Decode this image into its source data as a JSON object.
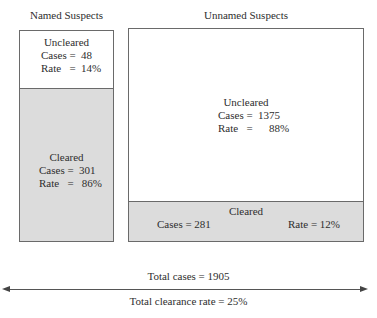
{
  "named": {
    "title": "Named Suspects",
    "uncleared": {
      "label": "Uncleared",
      "cases": "Cases =  48",
      "rate": "Rate   =  14%"
    },
    "cleared": {
      "label": "Cleared",
      "cases": "Cases =  301",
      "rate": "Rate   =   86%"
    }
  },
  "unnamed": {
    "title": "Unnamed Suspects",
    "uncleared": {
      "label": "Uncleared",
      "cases": "Cases =  1375",
      "rate": "Rate   =      88%"
    },
    "cleared": {
      "label": "Cleared",
      "cases": "Cases = 281",
      "rate": "Rate = 12%"
    }
  },
  "totals": {
    "cases": "Total cases = 1905",
    "clearance_rate": "Total clearance rate = 25%"
  },
  "colors": {
    "cleared_fill": "#dcdcdc",
    "uncleared_fill": "#ffffff",
    "border": "#6a6a6a"
  }
}
